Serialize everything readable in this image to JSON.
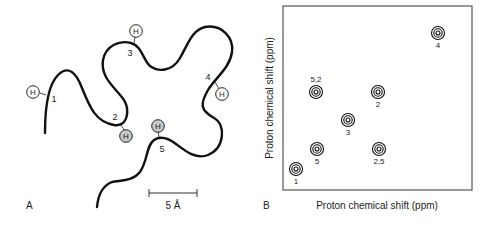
{
  "panel_a": {
    "label": "A",
    "scale_bar_label": "5 Å",
    "h_atom_label": "H",
    "residues": [
      {
        "id": "1",
        "label": "1",
        "shaded": false
      },
      {
        "id": "2",
        "label": "2",
        "shaded": true
      },
      {
        "id": "3",
        "label": "3",
        "shaded": false
      },
      {
        "id": "4",
        "label": "4",
        "shaded": false
      },
      {
        "id": "5",
        "label": "5",
        "shaded": true
      }
    ]
  },
  "panel_b": {
    "label": "B",
    "xlabel": "Proton chemical shift (ppm)",
    "ylabel": "Proton chemical shift (ppm)",
    "peaks": [
      {
        "label": "1"
      },
      {
        "label": "5"
      },
      {
        "label": "2,5"
      },
      {
        "label": "3"
      },
      {
        "label": "5,2"
      },
      {
        "label": "2"
      },
      {
        "label": "4"
      }
    ]
  },
  "colors": {
    "line": "#111111",
    "frame": "#444444",
    "shaded_h": "#c8c8c8"
  }
}
